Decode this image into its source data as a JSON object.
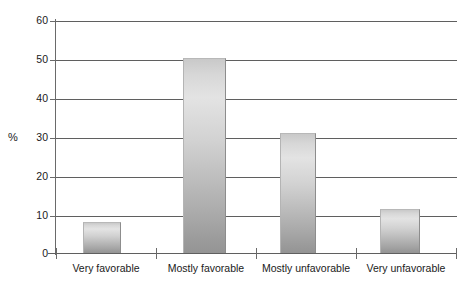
{
  "chart_data": {
    "type": "bar",
    "title": "",
    "subtitle": "",
    "xlabel": "",
    "ylabel": "%",
    "categories": [
      "Very favorable",
      "Mostly favorable",
      "Mostly unfavorable",
      "Very unfavorable"
    ],
    "values": [
      8,
      50.5,
      31,
      11.5
    ],
    "ylim": [
      0,
      60
    ],
    "yticks": [
      0,
      10,
      20,
      30,
      40,
      50,
      60
    ],
    "ytick_labels": [
      "0",
      "10",
      "20",
      "30",
      "40",
      "50",
      "60"
    ],
    "grid": true,
    "legend": false,
    "legend_position": "none",
    "annotations": [],
    "series": [
      {
        "name": "",
        "values": [
          8,
          50.5,
          31,
          11.5
        ]
      }
    ]
  },
  "style": {
    "bar_fill_top": "#e3e3e3",
    "bar_fill_bottom": "#949494",
    "gridline_color": "#5f5f5f",
    "axis_color": "#6a6a6a",
    "text_color": "#1a1a1a",
    "background": "#ffffff"
  }
}
